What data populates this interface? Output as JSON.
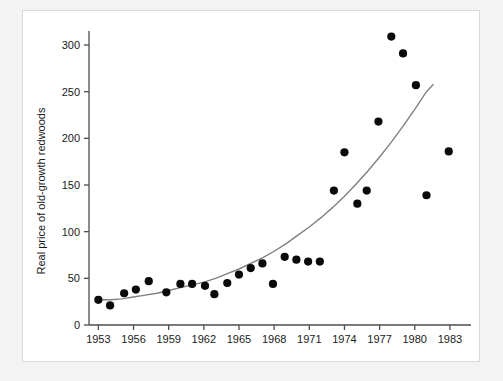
{
  "figure": {
    "background_color": "#f3f3f3",
    "panel_color": "#ffffff",
    "point_color": "#0a0a0a",
    "curve_color": "#808080",
    "axis_color": "#4d4d4d"
  },
  "chart_data": {
    "type": "scatter",
    "title": "",
    "xlabel": "",
    "ylabel": "Real price of old-growth redwoods",
    "xlim": [
      1952.2,
      1984.8
    ],
    "ylim": [
      0,
      315
    ],
    "xticks": [
      1953,
      1956,
      1959,
      1962,
      1965,
      1968,
      1971,
      1974,
      1977,
      1980,
      1983
    ],
    "xtick_labels": [
      "1953",
      "1956",
      "1959",
      "1962",
      "1965",
      "1968",
      "1971",
      "1974",
      "1977",
      "1980",
      "1983"
    ],
    "yticks": [
      0,
      50,
      100,
      150,
      200,
      250,
      300
    ],
    "ytick_labels": [
      "0",
      "50",
      "100",
      "150",
      "200",
      "250",
      "300"
    ],
    "grid": false,
    "legend": false,
    "series": [
      {
        "name": "Real price of old-growth redwoods",
        "marker": "filled-circle",
        "points": [
          {
            "x": 1953.0,
            "y": 27
          },
          {
            "x": 1954.0,
            "y": 21
          },
          {
            "x": 1955.2,
            "y": 34
          },
          {
            "x": 1956.2,
            "y": 38
          },
          {
            "x": 1957.3,
            "y": 47
          },
          {
            "x": 1958.8,
            "y": 35
          },
          {
            "x": 1960.0,
            "y": 44
          },
          {
            "x": 1961.0,
            "y": 44
          },
          {
            "x": 1962.1,
            "y": 42
          },
          {
            "x": 1962.9,
            "y": 33
          },
          {
            "x": 1964.0,
            "y": 45
          },
          {
            "x": 1965.0,
            "y": 54
          },
          {
            "x": 1966.0,
            "y": 61
          },
          {
            "x": 1967.0,
            "y": 66
          },
          {
            "x": 1967.9,
            "y": 44
          },
          {
            "x": 1968.9,
            "y": 73
          },
          {
            "x": 1969.9,
            "y": 70
          },
          {
            "x": 1970.9,
            "y": 68
          },
          {
            "x": 1971.9,
            "y": 68
          },
          {
            "x": 1973.1,
            "y": 144
          },
          {
            "x": 1974.0,
            "y": 185
          },
          {
            "x": 1975.1,
            "y": 130
          },
          {
            "x": 1975.9,
            "y": 144
          },
          {
            "x": 1976.9,
            "y": 218
          },
          {
            "x": 1978.0,
            "y": 309
          },
          {
            "x": 1979.0,
            "y": 291
          },
          {
            "x": 1980.1,
            "y": 257
          },
          {
            "x": 1981.0,
            "y": 139
          },
          {
            "x": 1982.9,
            "y": 186
          }
        ]
      }
    ],
    "fit_curve": {
      "name": "exponential-trend",
      "points": [
        {
          "x": 1953.0,
          "y": 27
        },
        {
          "x": 1954.0,
          "y": 27
        },
        {
          "x": 1955.0,
          "y": 28
        },
        {
          "x": 1956.0,
          "y": 30
        },
        {
          "x": 1957.0,
          "y": 32
        },
        {
          "x": 1958.0,
          "y": 34
        },
        {
          "x": 1959.0,
          "y": 37
        },
        {
          "x": 1960.0,
          "y": 40
        },
        {
          "x": 1961.0,
          "y": 43
        },
        {
          "x": 1962.0,
          "y": 46
        },
        {
          "x": 1963.0,
          "y": 50
        },
        {
          "x": 1964.0,
          "y": 55
        },
        {
          "x": 1965.0,
          "y": 60
        },
        {
          "x": 1966.0,
          "y": 66
        },
        {
          "x": 1967.0,
          "y": 72
        },
        {
          "x": 1968.0,
          "y": 79
        },
        {
          "x": 1969.0,
          "y": 87
        },
        {
          "x": 1970.0,
          "y": 96
        },
        {
          "x": 1971.0,
          "y": 105
        },
        {
          "x": 1972.0,
          "y": 115
        },
        {
          "x": 1973.0,
          "y": 126
        },
        {
          "x": 1974.0,
          "y": 138
        },
        {
          "x": 1975.0,
          "y": 151
        },
        {
          "x": 1976.0,
          "y": 165
        },
        {
          "x": 1977.0,
          "y": 180
        },
        {
          "x": 1978.0,
          "y": 196
        },
        {
          "x": 1979.0,
          "y": 213
        },
        {
          "x": 1980.0,
          "y": 231
        },
        {
          "x": 1981.0,
          "y": 250
        },
        {
          "x": 1981.6,
          "y": 258
        }
      ]
    }
  }
}
